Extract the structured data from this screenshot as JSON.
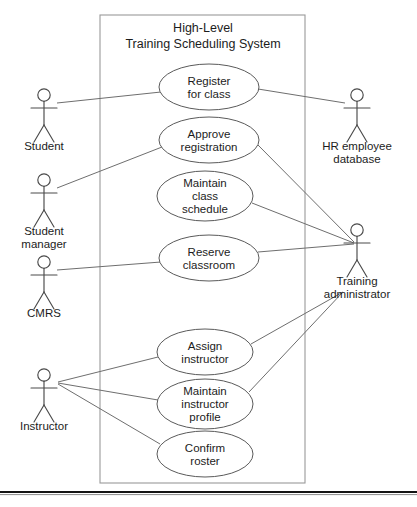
{
  "diagram": {
    "kind": "uml-use-case-diagram",
    "canvas": {
      "width": 417,
      "height": 507
    },
    "system_boundary": {
      "title_line1": "High-Level",
      "title_line2": "Training Scheduling System",
      "x": 100,
      "y": 15,
      "width": 205,
      "height": 468,
      "title_x": 203,
      "title_y1": 32,
      "title_y2": 48,
      "stroke": "#9a9a9a"
    },
    "use_cases": [
      {
        "id": "register-for-class",
        "lines": [
          "Register",
          "for class"
        ],
        "cx": 209,
        "cy": 87,
        "rx": 50,
        "ry": 23
      },
      {
        "id": "approve-registration",
        "lines": [
          "Approve",
          "registration"
        ],
        "cx": 209,
        "cy": 140,
        "rx": 50,
        "ry": 23
      },
      {
        "id": "maintain-class-schedule",
        "lines": [
          "Maintain",
          "class",
          "schedule"
        ],
        "cx": 205,
        "cy": 196,
        "rx": 48,
        "ry": 25
      },
      {
        "id": "reserve-classroom",
        "lines": [
          "Reserve",
          "classroom"
        ],
        "cx": 209,
        "cy": 258,
        "rx": 50,
        "ry": 23
      },
      {
        "id": "assign-instructor",
        "lines": [
          "Assign",
          "instructor"
        ],
        "cx": 205,
        "cy": 352,
        "rx": 48,
        "ry": 23
      },
      {
        "id": "maintain-instructor-profile",
        "lines": [
          "Maintain",
          "instructor",
          "profile"
        ],
        "cx": 205,
        "cy": 404,
        "rx": 48,
        "ry": 25
      },
      {
        "id": "confirm-roster",
        "lines": [
          "Confirm",
          "roster"
        ],
        "cx": 205,
        "cy": 454,
        "rx": 48,
        "ry": 23
      }
    ],
    "actors": [
      {
        "id": "student",
        "lines": [
          "Student"
        ],
        "x": 44,
        "y": 95,
        "label_y": 150
      },
      {
        "id": "student-manager",
        "lines": [
          "Student",
          "manager"
        ],
        "x": 44,
        "y": 180,
        "label_y": 235
      },
      {
        "id": "cmrs",
        "lines": [
          "CMRS"
        ],
        "x": 44,
        "y": 262,
        "label_y": 317
      },
      {
        "id": "instructor",
        "lines": [
          "Instructor"
        ],
        "x": 44,
        "y": 375,
        "label_y": 430
      },
      {
        "id": "hr-employee-database",
        "lines": [
          "HR employee",
          "database"
        ],
        "x": 357,
        "y": 95,
        "label_y": 150
      },
      {
        "id": "training-administrator",
        "lines": [
          "Training",
          "administrator"
        ],
        "x": 357,
        "y": 230,
        "label_y": 285
      }
    ],
    "associations": [
      {
        "id": "student--register-for-class",
        "x1": 57,
        "y1": 103,
        "x2": 161,
        "y2": 92
      },
      {
        "id": "hr-employee-database--register-for-class",
        "x1": 258,
        "y1": 89,
        "x2": 345,
        "y2": 103
      },
      {
        "id": "student-manager--approve-registration",
        "x1": 57,
        "y1": 188,
        "x2": 162,
        "y2": 147
      },
      {
        "id": "training-administrator--approve-registration",
        "x1": 258,
        "y1": 145,
        "x2": 354,
        "y2": 242
      },
      {
        "id": "training-administrator--maintain-class-schedule",
        "x1": 252,
        "y1": 203,
        "x2": 354,
        "y2": 243
      },
      {
        "id": "cmrs--reserve-classroom",
        "x1": 57,
        "y1": 270,
        "x2": 161,
        "y2": 262
      },
      {
        "id": "training-administrator--reserve-classroom",
        "x1": 258,
        "y1": 252,
        "x2": 354,
        "y2": 244
      },
      {
        "id": "instructor--assign-instructor",
        "x1": 58,
        "y1": 382,
        "x2": 158,
        "y2": 357
      },
      {
        "id": "training-administrator--assign-instructor",
        "x1": 251,
        "y1": 344,
        "x2": 343,
        "y2": 292
      },
      {
        "id": "instructor--maintain-instructor-profile",
        "x1": 58,
        "y1": 383,
        "x2": 158,
        "y2": 400
      },
      {
        "id": "training-administrator--maintain-instructor-profile",
        "x1": 249,
        "y1": 392,
        "x2": 342,
        "y2": 293
      },
      {
        "id": "instructor--confirm-roster",
        "x1": 58,
        "y1": 384,
        "x2": 160,
        "y2": 444
      }
    ],
    "footer": {
      "rule_y": 492,
      "rule_x1": 0,
      "rule_x2": 417,
      "clipped_caption": "",
      "caption_x": 36,
      "caption_y": 505
    }
  }
}
